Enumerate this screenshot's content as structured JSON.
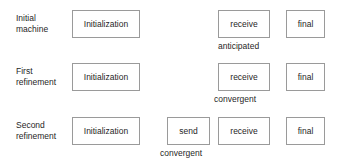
{
  "diagram": {
    "background_color": "#ffffff",
    "box_border_color": "#9a9a9a",
    "text_color": "#1f1f1f",
    "rows": [
      {
        "label": "Initial\nmachine",
        "label_line1": "Initial",
        "label_line2": "machine",
        "nodes": [
          {
            "label": "Initialization",
            "caption": ""
          },
          {
            "label": "receive",
            "caption": "anticipated"
          },
          {
            "label": "final",
            "caption": ""
          }
        ]
      },
      {
        "label": "First\nrefinement",
        "label_line1": "First",
        "label_line2": "refinement",
        "nodes": [
          {
            "label": "Initialization",
            "caption": ""
          },
          {
            "label": "receive",
            "caption": "convergent"
          },
          {
            "label": "final",
            "caption": ""
          }
        ]
      },
      {
        "label": "Second\nrefinement",
        "label_line1": "Second",
        "label_line2": "refinement",
        "nodes": [
          {
            "label": "Initialization",
            "caption": ""
          },
          {
            "label": "send",
            "caption": "convergent"
          },
          {
            "label": "receive",
            "caption": ""
          },
          {
            "label": "final",
            "caption": ""
          }
        ]
      }
    ]
  }
}
